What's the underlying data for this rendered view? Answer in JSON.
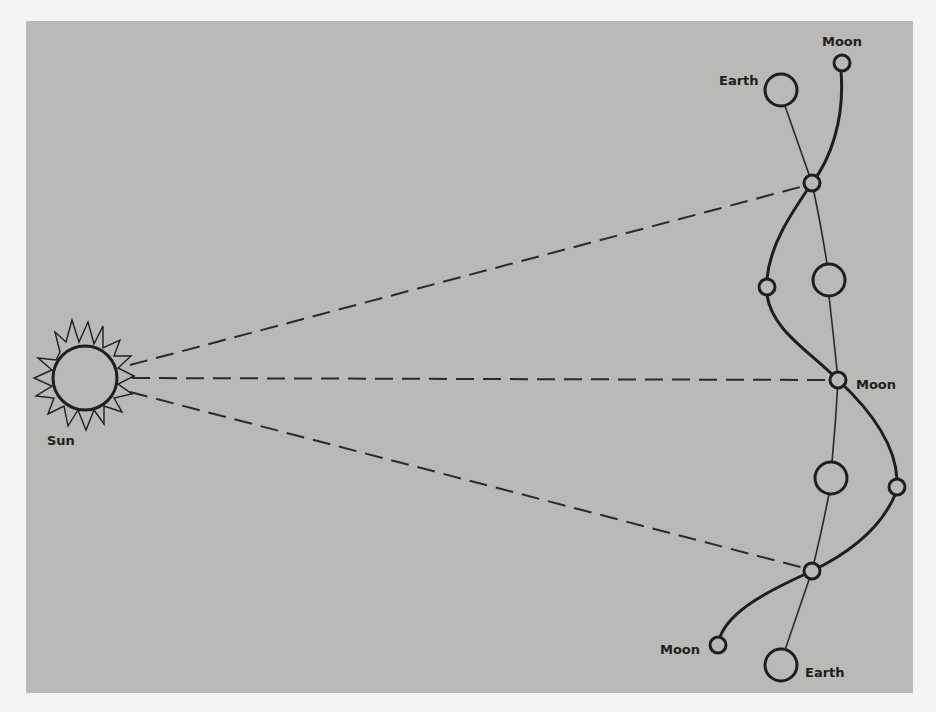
{
  "figure": {
    "background_color": "#b9b9b7",
    "stroke_color": "#1e1e1e",
    "labels": {
      "sun": "Sun",
      "earth_top": "Earth",
      "moon_top": "Moon",
      "moon_middle": "Moon",
      "moon_bottom": "Moon",
      "earth_bottom": "Earth"
    },
    "bodies": {
      "sun": {
        "cx": 85,
        "cy": 378,
        "r": 32
      },
      "earths": [
        {
          "cx": 781,
          "cy": 90
        },
        {
          "cx": 829,
          "cy": 280
        },
        {
          "cx": 831,
          "cy": 478
        },
        {
          "cx": 781,
          "cy": 665
        }
      ],
      "moons": [
        {
          "cx": 842,
          "cy": 63
        },
        {
          "cx": 812,
          "cy": 183
        },
        {
          "cx": 767,
          "cy": 287
        },
        {
          "cx": 838,
          "cy": 380
        },
        {
          "cx": 897,
          "cy": 487
        },
        {
          "cx": 812,
          "cy": 571
        },
        {
          "cx": 718,
          "cy": 645
        }
      ]
    },
    "sight_lines": [
      "sun-to-upper-moon",
      "sun-to-middle-moon",
      "sun-to-lower-moon"
    ]
  }
}
